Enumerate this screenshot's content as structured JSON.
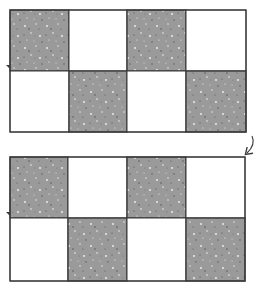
{
  "diagram": {
    "colors": {
      "shaded": "#9a9a9a",
      "empty": "#ffffff",
      "line": "#3a3a3a",
      "speck_light": "#f2f2f2",
      "speck_dark": "#4a4a4a"
    },
    "grids": [
      {
        "id": "top-grid",
        "x": 10,
        "y": 10,
        "width": 236,
        "height": 122,
        "col_edges": [
          10,
          69,
          127,
          186,
          246
        ],
        "row_edges": [
          10,
          71,
          132
        ],
        "cells": [
          [
            "shaded",
            "empty",
            "shaded",
            "empty"
          ],
          [
            "empty",
            "shaded",
            "empty",
            "shaded"
          ]
        ]
      },
      {
        "id": "bottom-grid",
        "x": 10,
        "y": 157,
        "width": 235,
        "height": 124,
        "col_edges": [
          10,
          68,
          127,
          186,
          245
        ],
        "row_edges": [
          157,
          218,
          281
        ],
        "cells": [
          [
            "shaded",
            "empty",
            "shaded",
            "empty"
          ],
          [
            "empty",
            "shaded",
            "empty",
            "shaded"
          ]
        ]
      }
    ],
    "arrow": {
      "icon": "curved-arrow-down-left",
      "from": [
        252,
        136
      ],
      "to": [
        247,
        153
      ]
    },
    "edge_marks": [
      {
        "x": 8,
        "y": 67
      },
      {
        "x": 8,
        "y": 214
      }
    ]
  }
}
